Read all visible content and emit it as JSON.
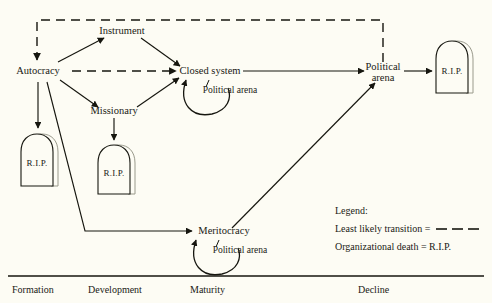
{
  "diagram": {
    "background_color": "#fdfcf4",
    "line_color": "#16160f",
    "nodes": {
      "autocracy": "Autocracy",
      "instrument": "Instrument",
      "missionary": "Missionary",
      "closed_system": "Closed system",
      "political_arena_top": "Political",
      "political_arena_top2": "arena",
      "meritocracy": "Meritocracy",
      "loop_closed_system": "Political arena",
      "loop_meritocracy": "Political arena"
    },
    "tombstones": {
      "label": "R.I.P.",
      "autocracy_death": "R.I.P.",
      "missionary_death": "R.I.P.",
      "political_arena_death": "R.I.P."
    },
    "legend": {
      "heading": "Legend:",
      "line1": "Least likely transition =",
      "line2": "Organizational death = R.I.P."
    },
    "phases": [
      {
        "label": "Formation"
      },
      {
        "label": "Development"
      },
      {
        "label": "Maturity"
      },
      {
        "label": "Decline"
      }
    ]
  }
}
